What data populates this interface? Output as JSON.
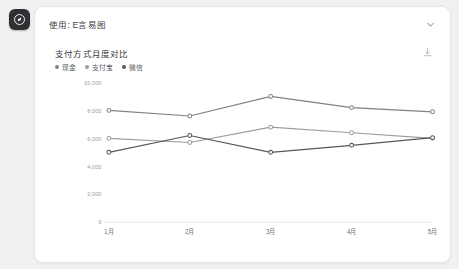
{
  "app": {
    "logo_icon": "app-logo-icon",
    "header_title": "使用: E言易图",
    "collapse_icon": "chevron-down-icon"
  },
  "card": {
    "title": "支付方式月度对比",
    "download_icon": "download-icon",
    "legend": [
      {
        "label": "现金",
        "color": "#808288"
      },
      {
        "label": "支付宝",
        "color": "#9a9ca1"
      },
      {
        "label": "微信",
        "color": "#55585d"
      }
    ]
  },
  "chart_data": {
    "type": "line",
    "title": "支付方式月度对比",
    "xlabel": "",
    "ylabel": "",
    "categories": [
      "1月",
      "2月",
      "3月",
      "4月",
      "5月"
    ],
    "ytick_labels": [
      "0",
      "2,000",
      "4,000",
      "6,000",
      "8,000",
      "10,000"
    ],
    "yticks": [
      0,
      2000,
      4000,
      6000,
      8000,
      10000
    ],
    "ylim": [
      0,
      10000
    ],
    "grid": false,
    "legend_position": "top-left",
    "markers": "circle",
    "series": [
      {
        "name": "现金",
        "color": "#808288",
        "values": [
          8000,
          7600,
          9000,
          8200,
          7900
        ]
      },
      {
        "name": "支付宝",
        "color": "#9a9ca1",
        "values": [
          6000,
          5700,
          6800,
          6400,
          6000
        ]
      },
      {
        "name": "微信",
        "color": "#55585d",
        "values": [
          5000,
          6200,
          5000,
          5500,
          6050
        ]
      }
    ]
  }
}
